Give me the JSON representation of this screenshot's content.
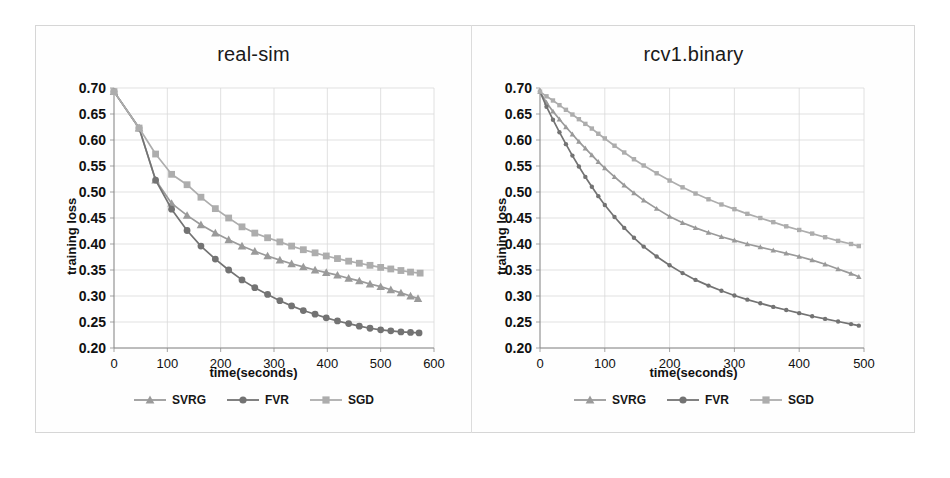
{
  "figure": {
    "background": "#ffffff",
    "frame_color": "#d6d6d6",
    "divider_color": "#dcdcdc"
  },
  "series_styles": {
    "SVRG": {
      "color": "#9a9a9a",
      "marker": "triangle"
    },
    "FVR": {
      "color": "#737373",
      "marker": "circle"
    },
    "SGD": {
      "color": "#adadad",
      "marker": "square"
    }
  },
  "left": {
    "title": "real-sim",
    "ylabel": "training loss",
    "xlabel": "time(seconds)",
    "legend": [
      {
        "label": "SVRG",
        "marker": "triangle-marker",
        "color": "#9a9a9a"
      },
      {
        "label": "FVR",
        "marker": "circle-marker",
        "color": "#737373"
      },
      {
        "label": "SGD",
        "marker": "square-marker",
        "color": "#adadad"
      }
    ]
  },
  "right": {
    "title": "rcv1.binary",
    "ylabel": "training loss",
    "xlabel": "time(seconds)",
    "legend": [
      {
        "label": "SVRG",
        "marker": "triangle-marker",
        "color": "#9a9a9a"
      },
      {
        "label": "FVR",
        "marker": "circle-marker",
        "color": "#737373"
      },
      {
        "label": "SGD",
        "marker": "square-marker",
        "color": "#adadad"
      }
    ]
  },
  "chart_data": [
    {
      "id": "real-sim",
      "type": "line",
      "title": "real-sim",
      "xlabel": "time(seconds)",
      "ylabel": "training loss",
      "xlim": [
        0,
        600
      ],
      "ylim": [
        0.2,
        0.7
      ],
      "xticks": [
        0,
        100,
        200,
        300,
        400,
        500,
        600
      ],
      "yticks": [
        0.2,
        0.25,
        0.3,
        0.35,
        0.4,
        0.45,
        0.5,
        0.55,
        0.6,
        0.65,
        0.7
      ],
      "grid": true,
      "legend_position": "bottom",
      "series": [
        {
          "name": "SVRG",
          "marker": "triangle",
          "color": "#9a9a9a",
          "x": [
            0,
            47,
            78,
            108,
            137,
            163,
            190,
            215,
            240,
            264,
            288,
            311,
            333,
            355,
            377,
            398,
            419,
            440,
            460,
            480,
            500,
            519,
            538,
            556,
            570
          ],
          "y": [
            0.693,
            0.623,
            0.523,
            0.478,
            0.455,
            0.437,
            0.421,
            0.408,
            0.396,
            0.386,
            0.377,
            0.369,
            0.362,
            0.356,
            0.35,
            0.345,
            0.34,
            0.334,
            0.329,
            0.323,
            0.318,
            0.312,
            0.306,
            0.3,
            0.295
          ]
        },
        {
          "name": "FVR",
          "marker": "circle",
          "color": "#737373",
          "x": [
            0,
            47,
            78,
            108,
            137,
            163,
            190,
            215,
            240,
            264,
            288,
            311,
            333,
            355,
            377,
            398,
            419,
            440,
            460,
            480,
            500,
            519,
            538,
            556,
            572
          ],
          "y": [
            0.693,
            0.623,
            0.523,
            0.467,
            0.426,
            0.396,
            0.371,
            0.35,
            0.331,
            0.316,
            0.303,
            0.291,
            0.281,
            0.272,
            0.265,
            0.258,
            0.252,
            0.247,
            0.242,
            0.238,
            0.235,
            0.233,
            0.231,
            0.23,
            0.229
          ]
        },
        {
          "name": "SGD",
          "marker": "square",
          "color": "#adadad",
          "x": [
            0,
            47,
            78,
            108,
            137,
            163,
            190,
            215,
            240,
            264,
            288,
            311,
            333,
            355,
            377,
            398,
            419,
            440,
            460,
            480,
            500,
            519,
            538,
            556,
            574
          ],
          "y": [
            0.693,
            0.623,
            0.573,
            0.534,
            0.514,
            0.49,
            0.468,
            0.45,
            0.433,
            0.421,
            0.412,
            0.404,
            0.396,
            0.389,
            0.383,
            0.377,
            0.372,
            0.367,
            0.363,
            0.359,
            0.355,
            0.352,
            0.349,
            0.346,
            0.344
          ]
        }
      ]
    },
    {
      "id": "rcv1.binary",
      "type": "line",
      "title": "rcv1.binary",
      "xlabel": "time(seconds)",
      "ylabel": "training loss",
      "xlim": [
        0,
        500
      ],
      "ylim": [
        0.2,
        0.7
      ],
      "xticks": [
        0,
        100,
        200,
        300,
        400,
        500
      ],
      "yticks": [
        0.2,
        0.25,
        0.3,
        0.35,
        0.4,
        0.45,
        0.5,
        0.55,
        0.6,
        0.65,
        0.7
      ],
      "grid": true,
      "legend_position": "bottom",
      "series": [
        {
          "name": "SVRG",
          "marker": "triangle",
          "color": "#9a9a9a",
          "x": [
            0,
            10,
            20,
            30,
            40,
            50,
            60,
            70,
            80,
            90,
            100,
            115,
            130,
            145,
            160,
            180,
            200,
            220,
            240,
            260,
            280,
            300,
            320,
            340,
            360,
            380,
            400,
            420,
            440,
            460,
            480,
            492
          ],
          "y": [
            0.693,
            0.672,
            0.655,
            0.64,
            0.625,
            0.611,
            0.597,
            0.584,
            0.571,
            0.558,
            0.546,
            0.529,
            0.513,
            0.498,
            0.484,
            0.468,
            0.453,
            0.441,
            0.431,
            0.422,
            0.414,
            0.407,
            0.4,
            0.394,
            0.388,
            0.382,
            0.376,
            0.369,
            0.361,
            0.352,
            0.343,
            0.337
          ]
        },
        {
          "name": "FVR",
          "marker": "circle",
          "color": "#737373",
          "x": [
            0,
            10,
            20,
            30,
            40,
            50,
            60,
            70,
            80,
            90,
            100,
            115,
            130,
            145,
            160,
            180,
            200,
            220,
            240,
            260,
            280,
            300,
            320,
            340,
            360,
            380,
            400,
            420,
            440,
            460,
            480,
            492
          ],
          "y": [
            0.693,
            0.664,
            0.639,
            0.615,
            0.592,
            0.57,
            0.549,
            0.529,
            0.51,
            0.492,
            0.475,
            0.452,
            0.431,
            0.412,
            0.395,
            0.376,
            0.359,
            0.344,
            0.331,
            0.32,
            0.31,
            0.301,
            0.293,
            0.286,
            0.279,
            0.273,
            0.267,
            0.261,
            0.256,
            0.251,
            0.246,
            0.243
          ]
        },
        {
          "name": "SGD",
          "marker": "square",
          "color": "#adadad",
          "x": [
            0,
            10,
            20,
            30,
            40,
            50,
            60,
            70,
            80,
            90,
            100,
            115,
            130,
            145,
            160,
            180,
            200,
            220,
            240,
            260,
            280,
            300,
            320,
            340,
            360,
            380,
            400,
            420,
            440,
            460,
            480,
            492
          ],
          "y": [
            0.693,
            0.684,
            0.676,
            0.667,
            0.658,
            0.649,
            0.64,
            0.631,
            0.622,
            0.612,
            0.603,
            0.589,
            0.576,
            0.563,
            0.551,
            0.536,
            0.522,
            0.509,
            0.497,
            0.486,
            0.476,
            0.467,
            0.458,
            0.45,
            0.442,
            0.434,
            0.427,
            0.42,
            0.413,
            0.406,
            0.4,
            0.396
          ]
        }
      ]
    }
  ]
}
